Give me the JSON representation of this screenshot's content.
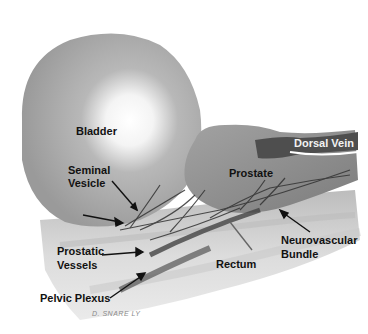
{
  "figure": {
    "labels": {
      "bladder": "Bladder",
      "dorsal_vein": "Dorsal Vein",
      "seminal_vesicle_line1": "Seminal",
      "seminal_vesicle_line2": "Vesicle",
      "prostate": "Prostate",
      "neurovascular_line1": "Neurovascular",
      "neurovascular_line2": "Bundle",
      "prostatic_vessels_line1": "Prostatic",
      "prostatic_vessels_line2": "Vessels",
      "rectum": "Rectum",
      "pelvic_plexus": "Pelvic Plexus"
    },
    "signature": "D. SNARE LY",
    "colors": {
      "bladder": "#a8a8a8",
      "bladder_highlight": "#ffffff",
      "prostate": "#8f8f8f",
      "dorsal_vein": "#555555",
      "rectum": "#c4c4c4",
      "nerves": "#3a3a3a",
      "arrows": "#111111"
    }
  }
}
